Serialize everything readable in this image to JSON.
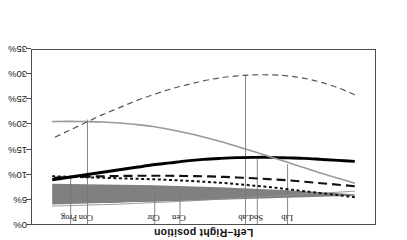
{
  "chart_data": {
    "type": "line",
    "title": "",
    "xlabel": "Left–Right position",
    "ylabel": "Expected vote",
    "xlim": [
      0.4,
      10.6
    ],
    "ylim": [
      0,
      35
    ],
    "y_inverted": true,
    "grid": false,
    "legend": "none",
    "orientation_note": "figure rendered rotated 180 degrees",
    "xticks": [
      1,
      2,
      3,
      4,
      5,
      6,
      7,
      8,
      9,
      10
    ],
    "yticks": [
      0,
      5,
      10,
      15,
      20,
      25,
      30,
      35
    ],
    "ytick_labels": [
      "0%",
      "5%",
      "10%",
      "15%",
      "20%",
      "25%",
      "30%",
      "35%"
    ],
    "annotations": [
      {
        "label": "Lib",
        "x": 3.0,
        "line_bottom_value": 12.0
      },
      {
        "label": "Soc",
        "x": 3.9,
        "line_bottom_value": 13.2
      },
      {
        "label": "Lab",
        "x": 4.25,
        "line_bottom_value": 30.0
      },
      {
        "label": "Cen",
        "x": 6.2,
        "line_bottom_value": 5.8
      },
      {
        "label": "Chr",
        "x": 6.95,
        "line_bottom_value": 6.5
      },
      {
        "label": "Con",
        "x": 8.95,
        "line_bottom_value": 21.0
      },
      {
        "label": "Prog",
        "x": 9.45,
        "line_bottom_value": 9.5
      }
    ],
    "x": [
      1,
      1.5,
      2,
      2.5,
      3,
      3.5,
      4,
      4.5,
      5,
      5.5,
      6,
      6.5,
      7,
      7.5,
      8,
      8.5,
      9,
      9.5,
      10
    ],
    "series": [
      {
        "name": "band-upper",
        "style": "band-edge",
        "color": "#808080",
        "values": [
          5.7,
          5.6,
          5.5,
          5.4,
          5.3,
          5.2,
          5.1,
          5.0,
          4.9,
          4.8,
          4.7,
          4.6,
          4.5,
          4.4,
          4.3,
          4.2,
          4.1,
          4.0,
          3.9
        ]
      },
      {
        "name": "band-lower",
        "style": "band-edge",
        "color": "#808080",
        "values": [
          6.0,
          6.2,
          6.4,
          6.6,
          6.8,
          6.95,
          7.1,
          7.25,
          7.4,
          7.5,
          7.6,
          7.7,
          7.8,
          7.85,
          7.9,
          7.95,
          8.0,
          8.05,
          8.1
        ]
      },
      {
        "name": "thin-gray-upper",
        "style": "solid-thin",
        "color": "#909090",
        "values": [
          6.6,
          6.4,
          6.2,
          6.0,
          5.8,
          5.6,
          5.4,
          5.2,
          5.0,
          4.8,
          4.6,
          4.45,
          4.3,
          4.15,
          4.0,
          3.9,
          3.8,
          3.7,
          3.6
        ]
      },
      {
        "name": "dotted-curve",
        "style": "dotted",
        "color": "#111111",
        "values": [
          5.4,
          5.8,
          6.2,
          6.6,
          7.0,
          7.4,
          7.7,
          8.0,
          8.3,
          8.5,
          8.7,
          8.85,
          9.0,
          9.1,
          9.2,
          9.3,
          9.4,
          9.5,
          9.6
        ]
      },
      {
        "name": "dashed-thick-curve",
        "style": "dashed-thick",
        "color": "#111111",
        "values": [
          7.6,
          7.9,
          8.2,
          8.5,
          8.8,
          9.0,
          9.2,
          9.35,
          9.5,
          9.6,
          9.65,
          9.7,
          9.7,
          9.7,
          9.65,
          9.6,
          9.5,
          9.4,
          9.3
        ]
      },
      {
        "name": "solid-black-curve",
        "style": "solid-thick",
        "color": "#000000",
        "values": [
          12.6,
          12.8,
          13.0,
          13.2,
          13.3,
          13.4,
          13.4,
          13.35,
          13.2,
          13.0,
          12.7,
          12.3,
          11.9,
          11.4,
          10.9,
          10.4,
          9.9,
          9.4,
          8.9
        ]
      },
      {
        "name": "solid-gray-curve",
        "style": "solid-medium",
        "color": "#999999",
        "values": [
          8.2,
          9.2,
          10.2,
          11.3,
          12.4,
          13.5,
          14.6,
          15.6,
          16.6,
          17.5,
          18.3,
          19.0,
          19.6,
          20.0,
          20.3,
          20.5,
          20.6,
          20.65,
          20.6
        ]
      },
      {
        "name": "thin-dashed-curve",
        "style": "dashed-thin",
        "color": "#555555",
        "values": [
          26.0,
          27.4,
          28.5,
          29.3,
          29.8,
          30.0,
          30.0,
          29.8,
          29.4,
          28.8,
          28.0,
          27.1,
          26.0,
          24.8,
          23.4,
          22.0,
          20.4,
          18.8,
          17.2
        ]
      }
    ]
  }
}
